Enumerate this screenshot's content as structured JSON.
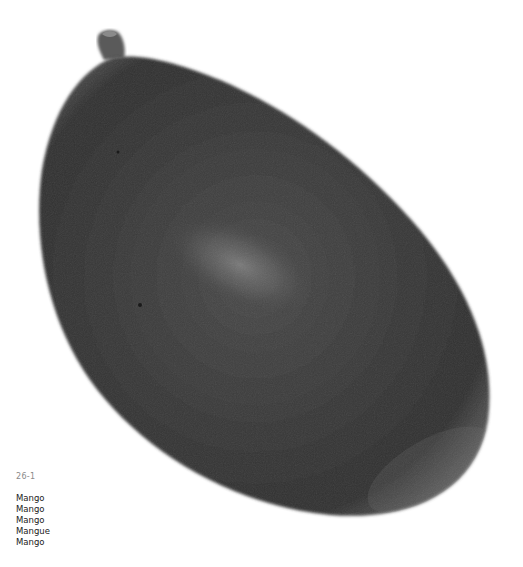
{
  "photo": {
    "subject": "Mango",
    "fruit_color": "#3a3a3a",
    "highlight_color": "#6a6a6a",
    "background": "#ffffff"
  },
  "caption": {
    "plate_number": "26-1",
    "names": [
      "Mango",
      "Mango",
      "Mango",
      "Mangue",
      "Mango"
    ]
  }
}
